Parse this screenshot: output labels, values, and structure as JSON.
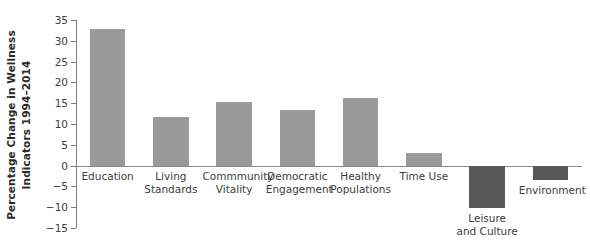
{
  "chart_data": {
    "type": "bar",
    "title": "",
    "xlabel": "",
    "ylabel": "Percentage Change in Wellness Indicators 1994–2014",
    "ylabel_lines": [
      "Percentage Change in Wellness",
      "Indicators 1994–2014"
    ],
    "categories": [
      "Education",
      "Living Standards",
      "Commmunity Vitality",
      "Democratic Engagement",
      "Healthy Populations",
      "Time Use",
      "Leisure and Culture",
      "Environment"
    ],
    "category_lines": [
      [
        "Education"
      ],
      [
        "Living",
        "Standards"
      ],
      [
        "Commmunity",
        "Vitality"
      ],
      [
        "Democratic",
        "Engagement"
      ],
      [
        "Healthy",
        "Populations"
      ],
      [
        "Time Use"
      ],
      [
        "Leisure",
        "and Culture"
      ],
      [
        "Environment"
      ]
    ],
    "values": [
      32.9,
      11.8,
      15.2,
      13.3,
      16.3,
      3.0,
      -10.2,
      -3.5
    ],
    "ylim": [
      -15,
      35
    ],
    "yticks": [
      35,
      30,
      25,
      20,
      15,
      10,
      5,
      0,
      -5,
      -10,
      -15
    ],
    "ytick_labels": [
      "35",
      "30",
      "25",
      "20",
      "15",
      "10",
      "5",
      "0",
      "−5",
      "−10",
      "−15"
    ],
    "grid": false,
    "legend": false,
    "colors": {
      "positive_bar": "#9a9a9a",
      "negative_bar": "#585858",
      "axis": "#7d7d7d",
      "text": "#3d3d3d",
      "title_text": "#2b2b2b",
      "background": "#ffffff"
    }
  }
}
